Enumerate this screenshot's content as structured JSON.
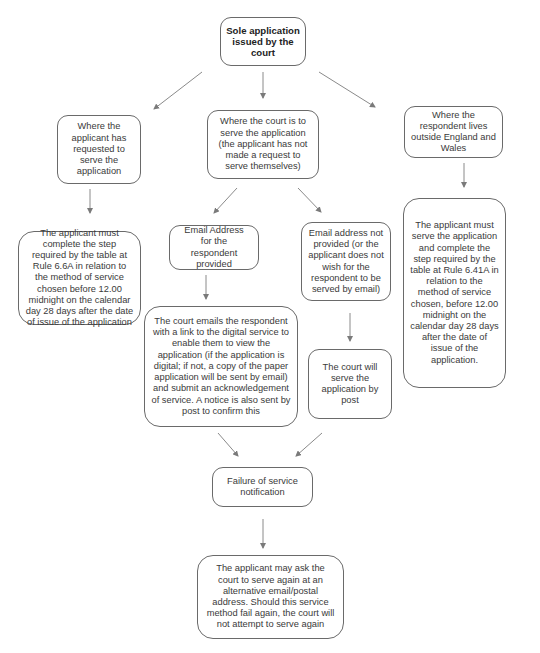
{
  "diagram": {
    "type": "flowchart",
    "colors": {
      "border": "#6a6a6a",
      "arrow": "#8a8a8a",
      "text": "#3a3a3a",
      "background": "#ffffff"
    },
    "nodes": {
      "start": "Sole application issued by the court",
      "applicant_requested": "Where the applicant has requested to serve the application",
      "court_serves": "Where the court is to serve the application (the applicant has not made a request to serve themselves)",
      "respondent_outside": "Where the respondent lives outside England and Wales",
      "applicant_must_66a": "The applicant must complete the step required by the table at Rule 6.6A in relation to the method of service chosen before 12.00 midnight on the calendar day 28 days after the date of issue of the application",
      "email_provided": "Email Address for the respondent provided",
      "email_not_provided": "Email address not provided (or the applicant does not wish for the respondent to be served by email)",
      "applicant_must_641a": "The applicant must serve the application and complete the step required by the table at Rule 6.41A in relation to the method of service chosen, before 12.00 midnight on the calendar day 28 days after the date of issue of the application.",
      "court_emails": "The court emails the respondent with a link to the digital service to enable them to view the application (if the application is digital; if not, a copy of the paper application will be sent by email) and submit an acknowledgement of service. A notice is also sent by post to confirm this",
      "court_post": "The court will serve the application by post",
      "failure": "Failure of service notification",
      "retry": "The applicant may ask the court to serve again at an alternative email/postal address. Should this service method fail again, the court will not attempt to serve again"
    },
    "edges": [
      [
        "start",
        "applicant_requested"
      ],
      [
        "start",
        "court_serves"
      ],
      [
        "start",
        "respondent_outside"
      ],
      [
        "applicant_requested",
        "applicant_must_66a"
      ],
      [
        "court_serves",
        "email_provided"
      ],
      [
        "court_serves",
        "email_not_provided"
      ],
      [
        "respondent_outside",
        "applicant_must_641a"
      ],
      [
        "email_provided",
        "court_emails"
      ],
      [
        "email_not_provided",
        "court_post"
      ],
      [
        "court_emails",
        "failure"
      ],
      [
        "court_post",
        "failure"
      ],
      [
        "failure",
        "retry"
      ]
    ]
  }
}
